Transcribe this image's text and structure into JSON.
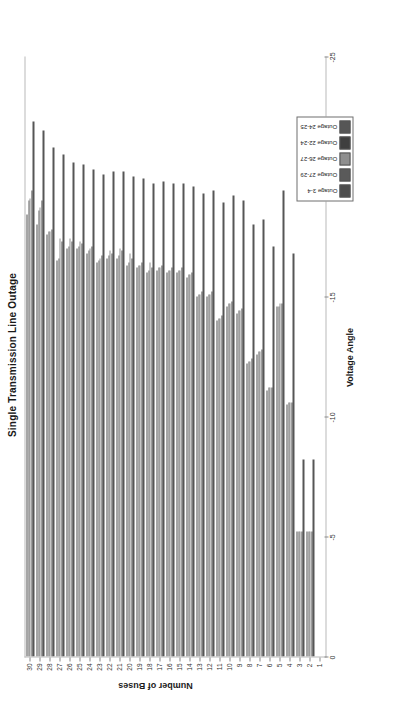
{
  "figure": {
    "title": "Single Transmission Line Outage",
    "xlabel": "Voltage Angle",
    "ylabel": "Number of Buses"
  },
  "legend": {
    "items": [
      {
        "label": "Outage 3-4",
        "color": "#4d4d4d"
      },
      {
        "label": "Outage 27-29",
        "color": "#5a5a5a"
      },
      {
        "label": "Outage 26-27",
        "color": "#8f8f8f"
      },
      {
        "label": "Outage 22-24",
        "color": "#3f3f3f"
      },
      {
        "label": "Outage 24-25",
        "color": "#565656"
      }
    ]
  },
  "chart_data": {
    "type": "bar",
    "orientation": "horizontal",
    "title": "Single Transmission Line Outage",
    "xlabel": "Voltage Angle",
    "ylabel": "Number of Buses",
    "xlim": [
      0,
      -25
    ],
    "xticks": [
      0,
      -5,
      -10,
      -15,
      -20,
      -25
    ],
    "grid": false,
    "legend_position": "bottom-right",
    "categories": [
      1,
      2,
      3,
      4,
      5,
      6,
      7,
      8,
      9,
      10,
      11,
      12,
      13,
      14,
      15,
      16,
      17,
      18,
      19,
      20,
      21,
      22,
      23,
      24,
      25,
      26,
      27,
      28,
      29,
      30
    ],
    "series": [
      {
        "name": "Outage 3-4",
        "color": "#4d4d4d",
        "values": [
          0,
          -5.2,
          -5.2,
          -10.5,
          -14.6,
          -11.1,
          -12.6,
          -12.2,
          -14.3,
          -14.6,
          -14.0,
          -15.0,
          -15.0,
          -15.8,
          -16.0,
          -16.0,
          -16.1,
          -16.0,
          -16.2,
          -16.3,
          -16.6,
          -16.6,
          -16.4,
          -16.8,
          -17.0,
          -17.0,
          -16.5,
          -17.6,
          -18.0,
          -18.4
        ]
      },
      {
        "name": "Outage 27-29",
        "color": "#5a5a5a",
        "values": [
          0,
          -5.2,
          -5.2,
          -10.6,
          -14.6,
          -11.2,
          -12.7,
          -12.3,
          -14.4,
          -14.7,
          -14.1,
          -15.1,
          -15.1,
          -15.9,
          -16.1,
          -16.1,
          -16.2,
          -16.1,
          -16.3,
          -16.4,
          -16.7,
          -16.7,
          -16.5,
          -16.9,
          -17.1,
          -17.1,
          -16.6,
          -17.7,
          -18.6,
          -19.0
        ]
      },
      {
        "name": "Outage 26-27",
        "color": "#8f8f8f",
        "values": [
          0,
          -5.2,
          -5.2,
          -10.6,
          -14.7,
          -11.2,
          -12.7,
          -12.3,
          -14.4,
          -14.7,
          -14.1,
          -15.1,
          -15.1,
          -15.9,
          -16.1,
          -16.1,
          -16.2,
          -16.4,
          -16.3,
          -16.8,
          -17.0,
          -16.9,
          -16.6,
          -17.0,
          -17.3,
          -17.4,
          -17.4,
          -17.7,
          -18.7,
          -19.1
        ]
      },
      {
        "name": "Outage 22-24",
        "color": "#3f3f3f",
        "values": [
          0,
          -5.2,
          -5.2,
          -10.6,
          -14.7,
          -11.2,
          -12.8,
          -12.4,
          -14.5,
          -14.8,
          -14.2,
          -15.2,
          -15.2,
          -16.0,
          -16.2,
          -16.2,
          -16.3,
          -16.2,
          -16.4,
          -16.6,
          -16.9,
          -16.8,
          -16.7,
          -17.1,
          -17.2,
          -17.3,
          -17.3,
          -17.8,
          -19.0,
          -19.4
        ]
      },
      {
        "name": "Outage 24-25",
        "color": "#565656",
        "values": [
          0,
          -8.2,
          -8.2,
          -16.8,
          -19.4,
          -17.1,
          -18.2,
          -18.0,
          -19.0,
          -19.2,
          -18.9,
          -19.4,
          -19.3,
          -19.6,
          -19.7,
          -19.7,
          -19.8,
          -19.7,
          -19.9,
          -20.0,
          -20.2,
          -20.2,
          -20.1,
          -20.3,
          -20.5,
          -20.6,
          -20.9,
          -21.2,
          -21.9,
          -22.3
        ]
      }
    ]
  }
}
